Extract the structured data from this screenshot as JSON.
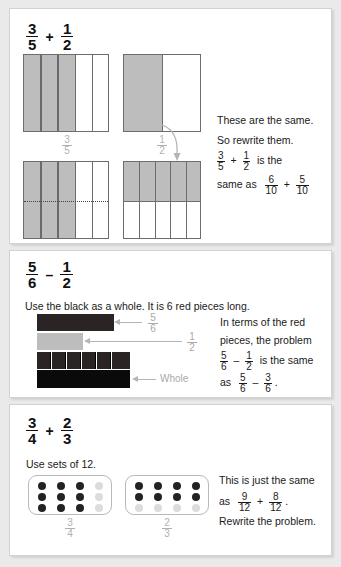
{
  "page": {
    "background": "#eaeaea",
    "panel_background": "#ffffff"
  },
  "colors": {
    "shade_gray": "#bdbdbd",
    "label_gray": "#b0b0b0",
    "black_bar": "#0a0a0a",
    "red_piece": "#2b2424",
    "dot_on": "#232323",
    "dot_off": "#dcdcdc",
    "text": "#1a1a1a"
  },
  "panel1": {
    "headline": {
      "left_num": "3",
      "left_den": "5",
      "operator": "+",
      "right_num": "1",
      "right_den": "2"
    },
    "label_left": {
      "num": "3",
      "den": "5"
    },
    "label_right": {
      "num": "1",
      "den": "2"
    },
    "text_line1": "These are the same.",
    "text_line2": "So rewrite them.",
    "text_line3_tail": "is the",
    "text_line4_head": "same as",
    "f1": {
      "num": "3",
      "den": "5"
    },
    "op1": "+",
    "f2": {
      "num": "1",
      "den": "2"
    },
    "f3": {
      "num": "6",
      "den": "10"
    },
    "op2": "+",
    "f4": {
      "num": "5",
      "den": "10"
    },
    "diagrams": {
      "top_left": {
        "columns": 5,
        "shaded": 3,
        "rows": 1
      },
      "top_right": {
        "columns": 2,
        "shaded": 1,
        "rows": 1
      },
      "bottom_left": {
        "columns": 5,
        "shaded": 3,
        "rows": 2,
        "split": "dotted-horizontal"
      },
      "bottom_right": {
        "columns": 5,
        "shaded_row": "top",
        "rows": 2
      }
    }
  },
  "panel2": {
    "headline": {
      "left_num": "5",
      "left_den": "6",
      "operator": "–",
      "right_num": "1",
      "right_den": "2"
    },
    "instruction": "Use the black as a whole. It is 6 red pieces long.",
    "label_five_sixths": {
      "num": "5",
      "den": "6"
    },
    "label_one_half": {
      "num": "1",
      "den": "2"
    },
    "label_whole": "Whole",
    "text_line1": "In terms of the red",
    "text_line2": "pieces, the problem",
    "text_line3_tail": "is the same",
    "text_line4_head": "as",
    "f1": {
      "num": "5",
      "den": "6"
    },
    "op1": "–",
    "f2": {
      "num": "1",
      "den": "2"
    },
    "f3": {
      "num": "5",
      "den": "6"
    },
    "op2": "–",
    "f4": {
      "num": "3",
      "den": "6"
    },
    "period": ".",
    "diagram": {
      "red_pieces_in_whole": 6,
      "top_bar_pieces": 5,
      "half_bar_pieces": 3
    }
  },
  "panel3": {
    "headline": {
      "left_num": "3",
      "left_den": "4",
      "operator": "+",
      "right_num": "2",
      "right_den": "3"
    },
    "instruction": "Use sets of 12.",
    "label_left": {
      "num": "3",
      "den": "4"
    },
    "label_right": {
      "num": "2",
      "den": "3"
    },
    "text_line1": "This is just the same",
    "text_line2_head": "as",
    "text_line3": "Rewrite the problem.",
    "f1": {
      "num": "9",
      "den": "12"
    },
    "op1": "+",
    "f2": {
      "num": "8",
      "den": "12"
    },
    "period": ".",
    "set_left": {
      "cols": 4,
      "rows": 3,
      "total": 12,
      "on": 9,
      "pattern": "last-column-off"
    },
    "set_right": {
      "cols": 4,
      "rows": 3,
      "total": 12,
      "on": 8,
      "pattern": "last-row-off"
    }
  }
}
